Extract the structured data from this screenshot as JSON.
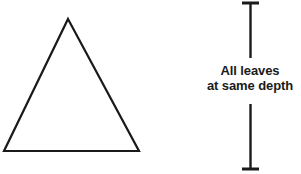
{
  "figure": {
    "background_color": "#ffffff",
    "stroke_color": "#1a1a1a",
    "text_color": "#1a1a1a",
    "width": 301,
    "height": 174
  },
  "triangle": {
    "name": "tree-shape-triangle",
    "apex": {
      "x": 68,
      "y": 19
    },
    "base_left": {
      "x": 4,
      "y": 151
    },
    "base_right": {
      "x": 139,
      "y": 151
    },
    "stroke_width": 2.2,
    "fill": "none"
  },
  "caliper": {
    "name": "depth-caliper",
    "axis_x": 250.5,
    "stroke_width": 2.4,
    "cap_stroke_width": 3,
    "top_cap": {
      "y": 3,
      "x1": 242,
      "x2": 259
    },
    "bottom_cap": {
      "y": 169,
      "x1": 242,
      "x2": 259
    },
    "upper_segment": {
      "y1": 3,
      "y2": 58
    },
    "lower_segment": {
      "y1": 104,
      "y2": 169
    }
  },
  "annotation": {
    "line1": "All leaves",
    "line2": "at same depth"
  }
}
